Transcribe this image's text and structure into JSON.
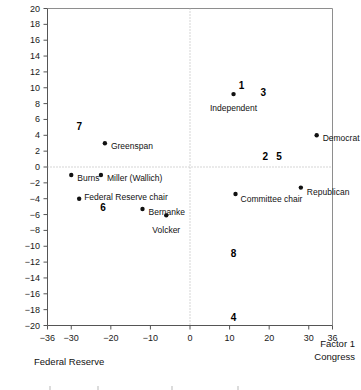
{
  "chart_data": {
    "type": "scatter",
    "title": "",
    "xlabel": "Factor 1",
    "ylabel": "Factor 2",
    "xlim": [
      -36,
      36
    ],
    "ylim": [
      -20,
      20
    ],
    "xticks": [
      -36,
      -30,
      -20,
      -10,
      0,
      10,
      20,
      30,
      36
    ],
    "xtick_labels": [
      "-36",
      "-30",
      "-20",
      "-10",
      "0",
      "10",
      "20",
      "30",
      "36"
    ],
    "yticks": [
      20,
      18,
      16,
      14,
      12,
      10,
      8,
      6,
      4,
      2,
      0,
      -2,
      -4,
      -6,
      -8,
      -10,
      -12,
      -14,
      -16,
      -18,
      -20
    ],
    "ytick_labels": [
      "20",
      "18",
      "16",
      "14",
      "12",
      "10",
      "8",
      "6",
      "4",
      "2",
      "0",
      "-2",
      "-4",
      "-6",
      "-8",
      "-10",
      "-12",
      "-14",
      "-16",
      "-18",
      "-20"
    ],
    "grid": false,
    "reference_lines": {
      "horizontal": 0,
      "vertical": 0,
      "style": "dotted"
    },
    "axis_corner_labels": {
      "left_bottom": "Federal Reserve",
      "right_bottom_primary": "Factor 1",
      "right_bottom_secondary": "Congress"
    },
    "points": [
      {
        "label": "Greenspan",
        "x": -21.5,
        "y": 3.0,
        "label_dx": 6,
        "label_dy": 3.5,
        "label_anchor": "left"
      },
      {
        "label": "Burns",
        "x": -30.0,
        "y": -1.0,
        "label_dx": 6,
        "label_dy": 3.5,
        "label_anchor": "left"
      },
      {
        "label": "Miller (Wallich)",
        "x": -22.5,
        "y": -1.0,
        "label_dx": 6,
        "label_dy": 3.5,
        "label_anchor": "left"
      },
      {
        "label": "Federal Reserve chair",
        "x": -28.0,
        "y": -4.0,
        "label_dx": 5,
        "label_dy": -1,
        "label_anchor": "left"
      },
      {
        "label": "Bernanke",
        "x": -12.0,
        "y": -5.3,
        "label_dx": 6,
        "label_dy": 3.5,
        "label_anchor": "left"
      },
      {
        "label": "Volcker",
        "x": -6.0,
        "y": -6.1,
        "label_dx": 0,
        "label_dy": 15,
        "label_anchor": "center"
      },
      {
        "label": "Independent",
        "x": 11.0,
        "y": 9.2,
        "label_dx": 0,
        "label_dy": 14,
        "label_anchor": "center"
      },
      {
        "label": "Democrat",
        "x": 32.0,
        "y": 4.0,
        "label_dx": 6,
        "label_dy": 3.5,
        "label_anchor": "left"
      },
      {
        "label": "Republican",
        "x": 28.0,
        "y": -2.6,
        "label_dx": 6,
        "label_dy": 4.5,
        "label_anchor": "left"
      },
      {
        "label": "Committee chair",
        "x": 11.5,
        "y": -3.4,
        "label_dx": 5,
        "label_dy": 5.5,
        "label_anchor": "left"
      }
    ],
    "cluster_numbers": [
      {
        "text": "7",
        "x": -28.0,
        "y": 5.0
      },
      {
        "text": "6",
        "x": -22.0,
        "y": -5.2
      },
      {
        "text": "1",
        "x": 13.0,
        "y": 10.2
      },
      {
        "text": "3",
        "x": 18.5,
        "y": 9.3
      },
      {
        "text": "2",
        "x": 19.0,
        "y": 1.3
      },
      {
        "text": "5",
        "x": 22.5,
        "y": 1.3
      },
      {
        "text": "8",
        "x": 11.0,
        "y": -11.0
      },
      {
        "text": "4",
        "x": 11.0,
        "y": -19.0
      }
    ]
  },
  "colors": {
    "axis": "#555555",
    "point": "#111111",
    "text": "#111111",
    "reference_line": "#aaaaaa",
    "background": "#ffffff"
  }
}
